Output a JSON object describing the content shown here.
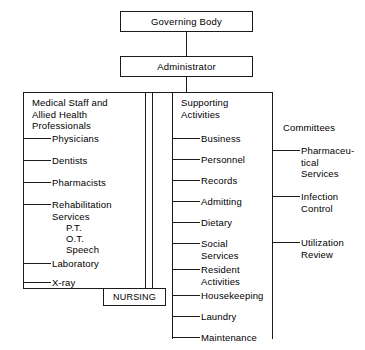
{
  "chart": {
    "top_nodes": [
      {
        "id": "governing-body",
        "label": "Governing Body"
      },
      {
        "id": "administrator",
        "label": "Administrator"
      }
    ],
    "nursing_node": {
      "id": "nursing",
      "label": "NURSING"
    },
    "columns": [
      {
        "id": "medical-staff",
        "heading": "Medical Staff and\nAllied Health\nProfessionals",
        "items": [
          {
            "label": "Physicians",
            "subitems": []
          },
          {
            "label": "Dentists",
            "subitems": []
          },
          {
            "label": "Pharmacists",
            "subitems": []
          },
          {
            "label": "Rehabilitation\nServices",
            "subitems": [
              "P.T.",
              "O.T.",
              "Speech"
            ]
          },
          {
            "label": "Laboratory",
            "subitems": []
          },
          {
            "label": "X-ray",
            "subitems": []
          }
        ]
      },
      {
        "id": "supporting-activities",
        "heading": "Supporting\nActivities",
        "items": [
          {
            "label": "Business",
            "subitems": []
          },
          {
            "label": "Personnel",
            "subitems": []
          },
          {
            "label": "Records",
            "subitems": []
          },
          {
            "label": "Admitting",
            "subitems": []
          },
          {
            "label": "Dietary",
            "subitems": []
          },
          {
            "label": "Social\nServices",
            "subitems": []
          },
          {
            "label": "Resident\nActivities",
            "subitems": []
          },
          {
            "label": "Housekeeping",
            "subitems": []
          },
          {
            "label": "Laundry",
            "subitems": []
          },
          {
            "label": "Maintenance",
            "subitems": []
          }
        ]
      },
      {
        "id": "committees",
        "heading": "Committees",
        "items": [
          {
            "label": "Pharmaceu-\ntical\nServices",
            "subitems": []
          },
          {
            "label": "Infection\nControl",
            "subitems": []
          },
          {
            "label": "Utilization\nReview",
            "subitems": []
          }
        ]
      }
    ],
    "colors": {
      "line": "#1a1a1a",
      "background": "#ffffff",
      "text": "#000000"
    }
  }
}
